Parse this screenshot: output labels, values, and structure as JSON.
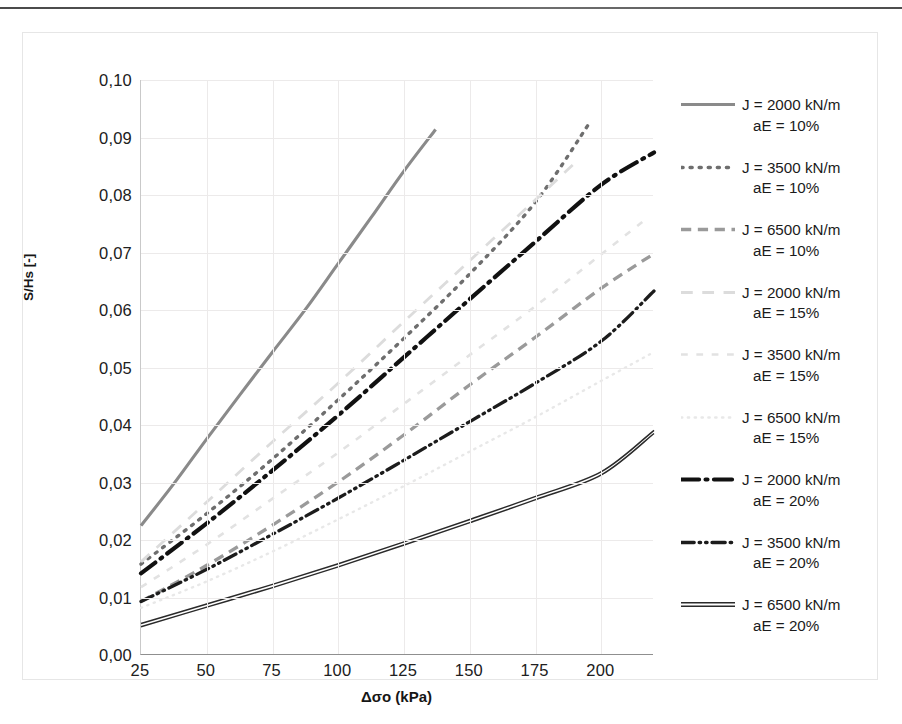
{
  "chart_data": {
    "type": "line",
    "title": "",
    "xlabel": "Δσo (kPa)",
    "ylabel": "S/Hs [-]",
    "xlim": [
      25,
      220
    ],
    "ylim": [
      0.0,
      0.1
    ],
    "xticks": [
      "25",
      "50",
      "75",
      "100",
      "125",
      "150",
      "175",
      "200"
    ],
    "xtick_values": [
      25,
      50,
      75,
      100,
      125,
      150,
      175,
      200
    ],
    "yticks": [
      "0,00",
      "0,01",
      "0,02",
      "0,03",
      "0,04",
      "0,05",
      "0,06",
      "0,07",
      "0,08",
      "0,09",
      "0,10"
    ],
    "ytick_values": [
      0.0,
      0.01,
      0.02,
      0.03,
      0.04,
      0.05,
      0.06,
      0.07,
      0.08,
      0.09,
      0.1
    ],
    "grid": true,
    "legend_position": "right",
    "series": [
      {
        "name": "J = 2000 kN/m aE = 10%",
        "label_line1": "J = 2000 kN/m",
        "label_line2": "aE = 10%",
        "style": "solid",
        "color": "#8a8a8a",
        "width": 3.1,
        "x": [
          25,
          37.5,
          50,
          62.5,
          75,
          87.5,
          100,
          112.5,
          125,
          137
        ],
        "y": [
          0.0225,
          0.0298,
          0.0376,
          0.0452,
          0.0527,
          0.0601,
          0.0681,
          0.0761,
          0.0842,
          0.0914
        ]
      },
      {
        "name": "J = 3500 kN/m aE = 10%",
        "label_line1": "J = 3500 kN/m",
        "label_line2": "aE = 10%",
        "style": "dotted",
        "color": "#6e6e6e",
        "width": 3.4,
        "x": [
          25,
          50,
          75,
          100,
          125,
          150,
          175,
          196
        ],
        "y": [
          0.0158,
          0.0246,
          0.0341,
          0.0444,
          0.0551,
          0.0663,
          0.0788,
          0.0929
        ]
      },
      {
        "name": "J = 6500 kN/m aE = 10%",
        "label_line1": "J = 6500 kN/m",
        "label_line2": "aE = 10%",
        "style": "dashed",
        "color": "#9a9a9a",
        "width": 3.3,
        "x": [
          25,
          50,
          75,
          100,
          125,
          150,
          175,
          200,
          220
        ],
        "y": [
          0.0093,
          0.0156,
          0.0226,
          0.0301,
          0.0383,
          0.047,
          0.0553,
          0.0638,
          0.0698
        ]
      },
      {
        "name": "J = 2000 kN/m aE = 15%",
        "label_line1": "J = 2000 kN/m",
        "label_line2": "aE = 15%",
        "style": "long-dash",
        "color": "#dcdcdc",
        "width": 2.8,
        "x": [
          25,
          50,
          75,
          100,
          125,
          150,
          175,
          190
        ],
        "y": [
          0.0162,
          0.0266,
          0.0371,
          0.0473,
          0.058,
          0.0686,
          0.0792,
          0.0856
        ]
      },
      {
        "name": "J = 3500 kN/m aE = 15%",
        "label_line1": "J = 3500 kN/m",
        "label_line2": "aE = 15%",
        "style": "sparse-dash",
        "color": "#e2e2e2",
        "width": 2.6,
        "x": [
          25,
          50,
          75,
          100,
          125,
          150,
          175,
          200,
          218
        ],
        "y": [
          0.0118,
          0.0192,
          0.0272,
          0.0352,
          0.0437,
          0.0522,
          0.0607,
          0.0697,
          0.0762
        ]
      },
      {
        "name": "J = 6500 kN/m aE = 15%",
        "label_line1": "J = 6500 kN/m",
        "label_line2": "aE = 15%",
        "style": "fine-dotted",
        "color": "#e8e8e8",
        "width": 2.4,
        "x": [
          25,
          50,
          75,
          100,
          125,
          150,
          175,
          200,
          220
        ],
        "y": [
          0.0082,
          0.0128,
          0.018,
          0.0236,
          0.0294,
          0.0354,
          0.0414,
          0.0477,
          0.0527
        ]
      },
      {
        "name": "J = 2000 kN/m aE = 20%",
        "label_line1": "J = 2000 kN/m",
        "label_line2": "aE = 20%",
        "style": "dash-dot",
        "color": "#111111",
        "width": 4.2,
        "x": [
          25,
          50,
          75,
          100,
          125,
          150,
          175,
          200,
          220
        ],
        "y": [
          0.0142,
          0.0229,
          0.0321,
          0.0417,
          0.0518,
          0.0619,
          0.0719,
          0.0818,
          0.0874
        ]
      },
      {
        "name": "J = 3500 kN/m aE = 20%",
        "label_line1": "J = 3500 kN/m",
        "label_line2": "aE = 20%",
        "style": "dash-dot-dot",
        "color": "#1c1c1c",
        "width": 3.3,
        "x": [
          25,
          50,
          75,
          100,
          125,
          150,
          175,
          200,
          220
        ],
        "y": [
          0.0093,
          0.0149,
          0.021,
          0.0273,
          0.0339,
          0.0406,
          0.0473,
          0.0546,
          0.0633
        ]
      },
      {
        "name": "J = 6500 kN/m aE = 20%",
        "label_line1": "J = 6500 kN/m",
        "label_line2": "aE = 20%",
        "style": "double-solid",
        "color": "#2a2a2a",
        "width": 3.2,
        "x": [
          25,
          50,
          75,
          100,
          125,
          150,
          175,
          200,
          220
        ],
        "y": [
          0.0052,
          0.0086,
          0.012,
          0.0156,
          0.0194,
          0.0233,
          0.0273,
          0.0316,
          0.0388
        ]
      }
    ]
  },
  "colors": {
    "grid": "#eceaea",
    "axis": "#8f8f8f",
    "text": "#1b1b1b",
    "container_border": "#e6e6e6"
  }
}
